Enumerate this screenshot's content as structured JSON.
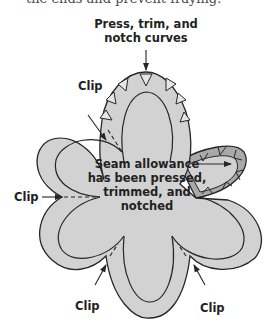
{
  "caption_fragment": "the ends and prevent fraying.",
  "diagram": {
    "title_label": [
      "Press, trim, and",
      "notch curves"
    ],
    "center_label": [
      "Seam allowance",
      "has been pressed,",
      "trimmed, and",
      "notched"
    ],
    "clip_labels": {
      "upper_left": "Clip",
      "left": "Clip",
      "bottom_left": "Clip",
      "bottom_right": "Clip"
    },
    "colors": {
      "fabric_fill": "#d2d2d2",
      "trimmed_band": "#a9a9a9",
      "outline": "#262626",
      "label_text": "#222222"
    }
  }
}
